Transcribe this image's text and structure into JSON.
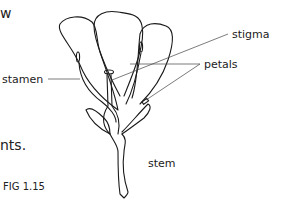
{
  "page_fragments": {
    "top_left": "w",
    "middle_left": "nts."
  },
  "figure": {
    "caption": "FIG 1.15",
    "labels": {
      "stamen": "stamen",
      "stigma": "stigma",
      "petals": "petals",
      "stem": "stem"
    }
  },
  "colors": {
    "line": "#1a1a1a",
    "leader": "#444444",
    "background": "#ffffff"
  }
}
